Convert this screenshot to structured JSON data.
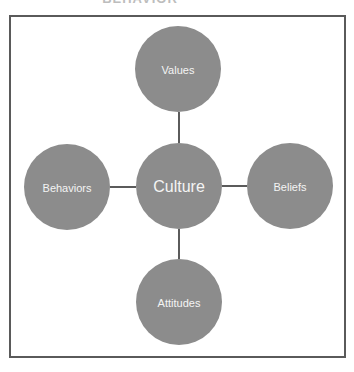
{
  "title_fragment": "BEHAVIOR",
  "colors": {
    "node_fill": "#8c8c8c",
    "connector": "#333333",
    "frame": "#5a5a5a",
    "label": "#f4f4f4"
  },
  "center": {
    "label": "Culture",
    "cx": 179,
    "cy": 186,
    "r": 43
  },
  "nodes": [
    {
      "label": "Values",
      "cx": 178,
      "cy": 69,
      "r": 43
    },
    {
      "label": "Behaviors",
      "cx": 67,
      "cy": 187,
      "r": 43
    },
    {
      "label": "Beliefs",
      "cx": 290,
      "cy": 186,
      "r": 43
    },
    {
      "label": "Attitudes",
      "cx": 179,
      "cy": 302,
      "r": 43
    }
  ]
}
